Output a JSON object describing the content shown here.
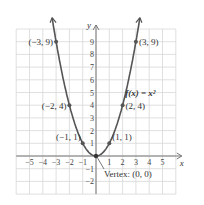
{
  "chart_data": {
    "type": "line",
    "title": "",
    "function_label": "f(x) = x²",
    "xlabel": "x",
    "ylabel": "y",
    "xlim": [
      -6,
      6
    ],
    "ylim": [
      -3,
      10
    ],
    "grid": true,
    "x_ticks": [
      "−5",
      "−4",
      "−3",
      "−2",
      "−1",
      "1",
      "2",
      "3",
      "4",
      "5"
    ],
    "y_ticks": [
      "−2",
      "−1",
      "1",
      "2",
      "3",
      "4",
      "5",
      "6",
      "7",
      "8",
      "9"
    ],
    "series": [
      {
        "name": "f(x) = x^2",
        "x": [
          -3,
          -2,
          -1,
          0,
          1,
          2,
          3
        ],
        "y": [
          9,
          4,
          1,
          0,
          1,
          4,
          9
        ]
      }
    ],
    "points": [
      {
        "label": "(−3, 9)",
        "x": -3,
        "y": 9
      },
      {
        "label": "(−2, 4)",
        "x": -2,
        "y": 4
      },
      {
        "label": "(−1, 1)",
        "x": -1,
        "y": 1
      },
      {
        "label": "(1, 1)",
        "x": 1,
        "y": 1
      },
      {
        "label": "(2, 4)",
        "x": 2,
        "y": 4
      },
      {
        "label": "(3, 9)",
        "x": 3,
        "y": 9
      }
    ],
    "annotations": [
      {
        "text": "Vertex: (0, 0)",
        "x": 0,
        "y": 0
      }
    ],
    "colors": {
      "curve": "#555555",
      "grid": "#d8d8d8",
      "axis": "#777777"
    }
  }
}
